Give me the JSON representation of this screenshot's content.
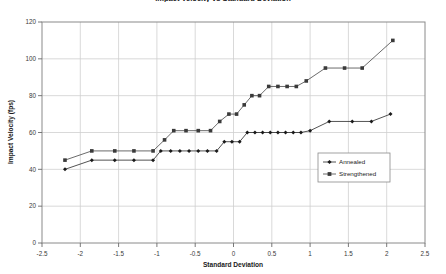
{
  "chart_data": {
    "type": "line",
    "title": "Impact Velocity vs Standard Deviation",
    "xlabel": "Standard Deviation",
    "ylabel": "Impact Velocity (fps)",
    "xlim": [
      -2.5,
      2.5
    ],
    "ylim": [
      0,
      120
    ],
    "xticks": [
      -2.5,
      -2,
      -1.5,
      -1,
      -0.5,
      0,
      0.5,
      1,
      1.5,
      2,
      2.5
    ],
    "xticklabels": [
      "-2.5",
      "-2",
      "-1.5",
      "-1",
      "-0.5",
      "0",
      "0.5",
      "1",
      "1.5",
      "2",
      "2.5"
    ],
    "yticks": [
      0,
      20,
      40,
      60,
      80,
      100,
      120
    ],
    "yticklabels": [
      "0",
      "20",
      "40",
      "60",
      "80",
      "100",
      "120"
    ],
    "grid": true,
    "legend_position": "center-right",
    "series": [
      {
        "name": "Annealed",
        "marker": "diamond",
        "color": "#1a1a1a",
        "points": [
          [
            -2.2,
            40
          ],
          [
            -1.85,
            45
          ],
          [
            -1.55,
            45
          ],
          [
            -1.3,
            45
          ],
          [
            -1.05,
            45
          ],
          [
            -0.95,
            50
          ],
          [
            -0.82,
            50
          ],
          [
            -0.7,
            50
          ],
          [
            -0.58,
            50
          ],
          [
            -0.46,
            50
          ],
          [
            -0.34,
            50
          ],
          [
            -0.22,
            50
          ],
          [
            -0.12,
            55
          ],
          [
            -0.02,
            55
          ],
          [
            0.08,
            55
          ],
          [
            0.18,
            60
          ],
          [
            0.28,
            60
          ],
          [
            0.38,
            60
          ],
          [
            0.48,
            60
          ],
          [
            0.58,
            60
          ],
          [
            0.68,
            60
          ],
          [
            0.78,
            60
          ],
          [
            0.88,
            60
          ],
          [
            1.0,
            61
          ],
          [
            1.25,
            66
          ],
          [
            1.55,
            66
          ],
          [
            1.8,
            66
          ],
          [
            2.05,
            70
          ]
        ]
      },
      {
        "name": "Strengthened",
        "marker": "square",
        "color": "#3a3a3a",
        "points": [
          [
            -2.2,
            45
          ],
          [
            -1.85,
            50
          ],
          [
            -1.55,
            50
          ],
          [
            -1.3,
            50
          ],
          [
            -1.05,
            50
          ],
          [
            -0.9,
            56
          ],
          [
            -0.78,
            61
          ],
          [
            -0.62,
            61
          ],
          [
            -0.46,
            61
          ],
          [
            -0.3,
            61
          ],
          [
            -0.18,
            66
          ],
          [
            -0.06,
            70
          ],
          [
            0.04,
            70
          ],
          [
            0.14,
            75
          ],
          [
            0.24,
            80
          ],
          [
            0.34,
            80
          ],
          [
            0.46,
            85
          ],
          [
            0.58,
            85
          ],
          [
            0.7,
            85
          ],
          [
            0.82,
            85
          ],
          [
            0.95,
            88
          ],
          [
            1.2,
            95
          ],
          [
            1.45,
            95
          ],
          [
            1.68,
            95
          ],
          [
            2.08,
            110
          ]
        ]
      }
    ]
  }
}
